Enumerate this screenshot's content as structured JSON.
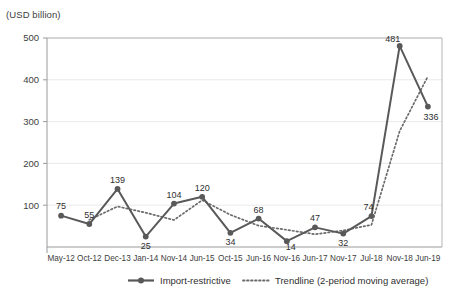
{
  "chart_data": {
    "type": "line",
    "title": "",
    "subtitle": "",
    "unit_label": "(USD billion)",
    "xlabel": "",
    "ylabel": "",
    "ylim": [
      0,
      500
    ],
    "yticks": [
      100,
      200,
      300,
      400,
      500
    ],
    "grid": true,
    "legend_position": "bottom",
    "categories": [
      "May-12",
      "Oct-12",
      "Dec-13",
      "Jan-14",
      "Nov-14",
      "Jun-15",
      "Oct-15",
      "Jun-16",
      "Nov-16",
      "Jun-17",
      "Nov-17",
      "Jul-18",
      "Nov-18",
      "Jun-19"
    ],
    "series": [
      {
        "name": "Import-restrictive",
        "style": "solid-with-markers",
        "color": "#595959",
        "values": [
          75,
          55,
          139,
          25,
          104,
          120,
          34,
          68,
          14,
          47,
          32,
          74,
          481,
          336
        ],
        "data_labels": [
          "75",
          "55",
          "139",
          "25",
          "104",
          "120",
          "34",
          "68",
          "14",
          "47",
          "32",
          "74",
          "481",
          "336"
        ]
      },
      {
        "name": "Trendline (2-period moving average)",
        "style": "dotted",
        "color": "#6b6b6b",
        "values": [
          null,
          65,
          97,
          82,
          64.5,
          112,
          77,
          51,
          41,
          30.5,
          39.5,
          53,
          277.5,
          408.5
        ]
      }
    ],
    "legend": [
      {
        "label": "Import-restrictive",
        "marker": "line-with-dot",
        "color": "#595959"
      },
      {
        "label": "Trendline (2-period moving average)",
        "marker": "dotted-line",
        "color": "#6b6b6b"
      }
    ]
  }
}
